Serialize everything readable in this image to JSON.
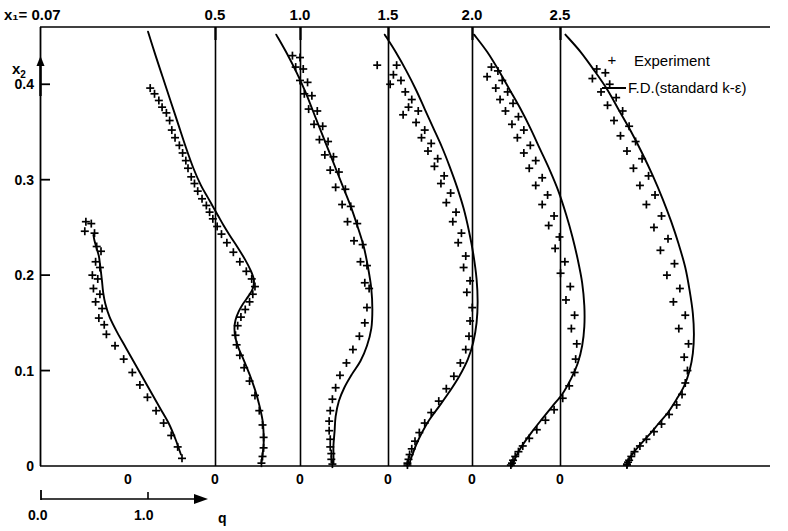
{
  "figure": {
    "x1_prefix": "x₁=",
    "y_axis_label": "x₂",
    "q_axis_label": "q"
  },
  "legend": {
    "position": "top-right",
    "items": [
      {
        "marker": "plus-marker",
        "label": "Experiment"
      },
      {
        "marker": "line-marker",
        "label": "F.D.(standard k-ε)"
      }
    ]
  },
  "axes": {
    "top_label_prefix": "x₁= 0.07",
    "top_tick_labels": [
      "0.5",
      "1.0",
      "1.5",
      "2.0",
      "2.5"
    ],
    "y_tick_labels": [
      "0",
      "0.1",
      "0.2",
      "0.3",
      "0.4"
    ],
    "y_tick_values": [
      0,
      0.1,
      0.2,
      0.3,
      0.4
    ],
    "station_zero_labels": [
      "0",
      "0",
      "0",
      "0",
      "0",
      "0"
    ],
    "scale_bar": {
      "start": "0.0",
      "mid": "1.0",
      "arrow_label": "q"
    }
  },
  "chart_data": {
    "type": "line",
    "title": "",
    "subtitle": "",
    "xlabel": "q",
    "ylabel": "x₂",
    "grid": false,
    "legend_position": "top-right",
    "ylim": [
      0,
      0.46
    ],
    "q_scale_px_per_unit": 108,
    "stations": [
      {
        "x1": 0.07,
        "baseline_label": "0",
        "baseline_px": 128,
        "model_curve": {
          "name": "F.D.(standard k-ε)",
          "q": [
            -0.32,
            -0.31,
            -0.29,
            -0.27,
            -0.26,
            -0.25,
            -0.24,
            -0.23,
            -0.21,
            -0.17,
            -0.1,
            -0.02,
            0.06,
            0.14,
            0.22,
            0.3,
            0.38,
            0.44,
            0.49
          ],
          "x2": [
            0.242,
            0.236,
            0.228,
            0.22,
            0.212,
            0.203,
            0.193,
            0.182,
            0.17,
            0.156,
            0.14,
            0.124,
            0.108,
            0.092,
            0.076,
            0.06,
            0.044,
            0.028,
            0.012
          ]
        },
        "experiment": {
          "name": "Experiment",
          "q": [
            -0.39,
            -0.34,
            -0.4,
            -0.31,
            -0.29,
            -0.25,
            -0.3,
            -0.26,
            -0.33,
            -0.28,
            -0.32,
            -0.26,
            -0.3,
            -0.24,
            -0.27,
            -0.22,
            -0.2,
            -0.12,
            -0.04,
            0.04,
            0.11,
            0.18,
            0.26,
            0.33,
            0.4,
            0.46,
            0.5
          ],
          "x2": [
            0.256,
            0.254,
            0.246,
            0.244,
            0.23,
            0.225,
            0.214,
            0.208,
            0.2,
            0.196,
            0.186,
            0.18,
            0.172,
            0.165,
            0.155,
            0.148,
            0.138,
            0.126,
            0.112,
            0.098,
            0.085,
            0.072,
            0.058,
            0.045,
            0.032,
            0.02,
            0.008
          ]
        }
      },
      {
        "x1": 0.5,
        "baseline_label": "0",
        "baseline_px": 215,
        "model_curve": {
          "name": "F.D.(standard k-ε)",
          "q": [
            -0.62,
            -0.55,
            -0.48,
            -0.41,
            -0.34,
            -0.27,
            -0.2,
            -0.13,
            -0.07,
            -0.02,
            0.03,
            0.08,
            0.14,
            0.21,
            0.28,
            0.33,
            0.36,
            0.35,
            0.31,
            0.26,
            0.22,
            0.19,
            0.18,
            0.19,
            0.22,
            0.27,
            0.32,
            0.37,
            0.41,
            0.44,
            0.45,
            0.45,
            0.44,
            0.43
          ],
          "x2": [
            0.455,
            0.43,
            0.406,
            0.382,
            0.358,
            0.334,
            0.312,
            0.294,
            0.282,
            0.272,
            0.262,
            0.252,
            0.241,
            0.229,
            0.216,
            0.205,
            0.195,
            0.186,
            0.178,
            0.17,
            0.162,
            0.153,
            0.144,
            0.134,
            0.123,
            0.11,
            0.096,
            0.08,
            0.064,
            0.048,
            0.034,
            0.022,
            0.012,
            0.004
          ]
        },
        "experiment": {
          "name": "Experiment",
          "q": [
            -0.6,
            -0.56,
            -0.52,
            -0.49,
            -0.45,
            -0.42,
            -0.4,
            -0.37,
            -0.33,
            -0.3,
            -0.27,
            -0.25,
            -0.22,
            -0.19,
            -0.16,
            -0.12,
            -0.08,
            -0.05,
            -0.02,
            0.02,
            0.06,
            0.11,
            0.17,
            0.23,
            0.29,
            0.34,
            0.37,
            0.35,
            0.32,
            0.28,
            0.24,
            0.21,
            0.19,
            0.2,
            0.23,
            0.27,
            0.32,
            0.37,
            0.41,
            0.44,
            0.45,
            0.45,
            0.44,
            0.43
          ],
          "x2": [
            0.396,
            0.39,
            0.383,
            0.376,
            0.37,
            0.362,
            0.352,
            0.344,
            0.336,
            0.328,
            0.32,
            0.312,
            0.303,
            0.296,
            0.288,
            0.28,
            0.273,
            0.266,
            0.259,
            0.251,
            0.243,
            0.234,
            0.224,
            0.214,
            0.204,
            0.196,
            0.188,
            0.18,
            0.172,
            0.164,
            0.156,
            0.147,
            0.137,
            0.127,
            0.116,
            0.103,
            0.089,
            0.074,
            0.058,
            0.043,
            0.03,
            0.019,
            0.01,
            0.003
          ]
        }
      },
      {
        "x1": 1.0,
        "baseline_label": "0",
        "baseline_px": 300,
        "model_curve": {
          "name": "F.D.(standard k-ε)",
          "q": [
            -0.22,
            -0.12,
            -0.03,
            0.05,
            0.12,
            0.19,
            0.26,
            0.33,
            0.4,
            0.47,
            0.53,
            0.59,
            0.63,
            0.66,
            0.67,
            0.66,
            0.62,
            0.56,
            0.48,
            0.41,
            0.36,
            0.33,
            0.32,
            0.31,
            0.31,
            0.31
          ],
          "x2": [
            0.452,
            0.432,
            0.412,
            0.392,
            0.372,
            0.352,
            0.332,
            0.312,
            0.292,
            0.272,
            0.252,
            0.23,
            0.208,
            0.186,
            0.164,
            0.144,
            0.126,
            0.11,
            0.096,
            0.082,
            0.068,
            0.052,
            0.036,
            0.022,
            0.011,
            0.003
          ]
        },
        "experiment": {
          "name": "Experiment",
          "q": [
            -0.07,
            0.0,
            -0.04,
            0.03,
            0.0,
            0.07,
            0.04,
            0.11,
            0.08,
            0.16,
            0.13,
            0.21,
            0.18,
            0.26,
            0.23,
            0.31,
            0.28,
            0.36,
            0.33,
            0.42,
            0.39,
            0.47,
            0.44,
            0.53,
            0.5,
            0.58,
            0.56,
            0.62,
            0.6,
            0.64,
            0.62,
            0.6,
            0.55,
            0.49,
            0.43,
            0.37,
            0.33,
            0.3,
            0.28,
            0.27,
            0.27,
            0.28,
            0.28,
            0.29,
            0.29,
            0.3
          ],
          "x2": [
            0.43,
            0.428,
            0.418,
            0.416,
            0.404,
            0.402,
            0.39,
            0.388,
            0.374,
            0.372,
            0.358,
            0.356,
            0.342,
            0.34,
            0.326,
            0.324,
            0.31,
            0.308,
            0.292,
            0.29,
            0.274,
            0.272,
            0.256,
            0.254,
            0.236,
            0.232,
            0.214,
            0.21,
            0.192,
            0.186,
            0.166,
            0.15,
            0.136,
            0.122,
            0.108,
            0.095,
            0.082,
            0.07,
            0.058,
            0.047,
            0.037,
            0.028,
            0.02,
            0.013,
            0.007,
            0.002
          ]
        }
      },
      {
        "x1": 1.5,
        "baseline_label": "0",
        "baseline_px": 388,
        "model_curve": {
          "name": "F.D.(standard k-ε)",
          "q": [
            -0.03,
            0.07,
            0.17,
            0.26,
            0.34,
            0.42,
            0.5,
            0.57,
            0.64,
            0.7,
            0.75,
            0.79,
            0.82,
            0.83,
            0.82,
            0.79,
            0.74,
            0.66,
            0.57,
            0.47,
            0.38,
            0.31,
            0.26,
            0.23,
            0.21,
            0.2
          ],
          "x2": [
            0.452,
            0.434,
            0.414,
            0.394,
            0.374,
            0.354,
            0.334,
            0.314,
            0.292,
            0.27,
            0.246,
            0.222,
            0.196,
            0.172,
            0.15,
            0.13,
            0.112,
            0.094,
            0.078,
            0.062,
            0.048,
            0.034,
            0.022,
            0.013,
            0.007,
            0.002
          ]
        },
        "experiment": {
          "name": "Experiment",
          "q": [
            -0.1,
            0.08,
            0.05,
            0.12,
            0.02,
            0.16,
            0.22,
            0.19,
            0.28,
            0.14,
            0.26,
            0.34,
            0.31,
            0.4,
            0.37,
            0.46,
            0.43,
            0.52,
            0.49,
            0.58,
            0.54,
            0.63,
            0.6,
            0.68,
            0.65,
            0.72,
            0.7,
            0.76,
            0.73,
            0.78,
            0.76,
            0.75,
            0.72,
            0.67,
            0.61,
            0.54,
            0.47,
            0.4,
            0.34,
            0.29,
            0.25,
            0.22,
            0.2,
            0.19,
            0.18,
            0.18
          ],
          "x2": [
            0.42,
            0.42,
            0.41,
            0.404,
            0.4,
            0.392,
            0.384,
            0.376,
            0.372,
            0.368,
            0.36,
            0.352,
            0.344,
            0.338,
            0.33,
            0.322,
            0.314,
            0.304,
            0.296,
            0.286,
            0.276,
            0.266,
            0.256,
            0.244,
            0.234,
            0.22,
            0.208,
            0.194,
            0.182,
            0.166,
            0.152,
            0.136,
            0.122,
            0.108,
            0.094,
            0.081,
            0.068,
            0.056,
            0.045,
            0.035,
            0.026,
            0.018,
            0.012,
            0.007,
            0.003,
            0.001
          ]
        }
      },
      {
        "x1": 2.0,
        "baseline_label": "0",
        "baseline_px": 472,
        "model_curve": {
          "name": "F.D.(standard k-ε)",
          "q": [
            0.02,
            0.14,
            0.25,
            0.35,
            0.45,
            0.54,
            0.63,
            0.72,
            0.8,
            0.87,
            0.93,
            0.98,
            1.02,
            1.04,
            1.04,
            1.02,
            0.98,
            0.92,
            0.84,
            0.74,
            0.64,
            0.55,
            0.48,
            0.43,
            0.4,
            0.38
          ],
          "x2": [
            0.452,
            0.434,
            0.414,
            0.394,
            0.374,
            0.354,
            0.332,
            0.31,
            0.288,
            0.264,
            0.24,
            0.216,
            0.192,
            0.168,
            0.146,
            0.126,
            0.108,
            0.092,
            0.076,
            0.062,
            0.048,
            0.035,
            0.024,
            0.015,
            0.008,
            0.002
          ]
        },
        "experiment": {
          "name": "Experiment",
          "q": [
            0.18,
            0.24,
            0.14,
            0.28,
            0.22,
            0.33,
            0.26,
            0.38,
            0.31,
            0.43,
            0.37,
            0.48,
            0.42,
            0.54,
            0.48,
            0.59,
            0.53,
            0.65,
            0.59,
            0.7,
            0.65,
            0.76,
            0.71,
            0.81,
            0.77,
            0.86,
            0.82,
            0.91,
            0.87,
            0.95,
            0.92,
            0.97,
            0.96,
            0.95,
            0.9,
            0.84,
            0.76,
            0.68,
            0.6,
            0.53,
            0.47,
            0.43,
            0.4,
            0.38,
            0.37,
            0.36
          ],
          "x2": [
            0.418,
            0.414,
            0.408,
            0.404,
            0.396,
            0.392,
            0.384,
            0.38,
            0.372,
            0.366,
            0.358,
            0.352,
            0.344,
            0.336,
            0.328,
            0.32,
            0.312,
            0.302,
            0.294,
            0.284,
            0.274,
            0.262,
            0.252,
            0.24,
            0.228,
            0.214,
            0.202,
            0.188,
            0.174,
            0.158,
            0.144,
            0.128,
            0.112,
            0.098,
            0.084,
            0.071,
            0.059,
            0.048,
            0.038,
            0.029,
            0.021,
            0.015,
            0.01,
            0.006,
            0.003,
            0.001
          ]
        }
      },
      {
        "x1": 2.5,
        "baseline_label": "0",
        "baseline_px": 560,
        "model_curve": {
          "name": "F.D.(standard k-ε)",
          "q": [
            0.05,
            0.19,
            0.32,
            0.44,
            0.55,
            0.66,
            0.76,
            0.86,
            0.95,
            1.03,
            1.1,
            1.16,
            1.2,
            1.23,
            1.24,
            1.23,
            1.2,
            1.15,
            1.08,
            1.0,
            0.91,
            0.82,
            0.74,
            0.68,
            0.64,
            0.62
          ],
          "x2": [
            0.452,
            0.434,
            0.414,
            0.394,
            0.372,
            0.35,
            0.328,
            0.304,
            0.28,
            0.256,
            0.232,
            0.208,
            0.184,
            0.16,
            0.138,
            0.118,
            0.1,
            0.084,
            0.07,
            0.056,
            0.044,
            0.032,
            0.022,
            0.014,
            0.007,
            0.002
          ]
        },
        "experiment": {
          "name": "Experiment",
          "q": [
            0.34,
            0.42,
            0.3,
            0.46,
            0.38,
            0.52,
            0.44,
            0.58,
            0.5,
            0.64,
            0.56,
            0.7,
            0.62,
            0.76,
            0.68,
            0.82,
            0.74,
            0.88,
            0.8,
            0.94,
            0.87,
            1.0,
            0.93,
            1.06,
            0.99,
            1.11,
            1.05,
            1.16,
            1.1,
            1.19,
            1.15,
            1.18,
            1.16,
            1.13,
            1.08,
            1.01,
            0.94,
            0.87,
            0.8,
            0.74,
            0.69,
            0.66,
            0.64,
            0.63,
            0.62,
            0.62
          ],
          "x2": [
            0.416,
            0.412,
            0.406,
            0.4,
            0.392,
            0.386,
            0.378,
            0.372,
            0.362,
            0.356,
            0.346,
            0.34,
            0.33,
            0.322,
            0.312,
            0.304,
            0.294,
            0.284,
            0.274,
            0.262,
            0.25,
            0.238,
            0.226,
            0.212,
            0.2,
            0.186,
            0.172,
            0.158,
            0.144,
            0.128,
            0.114,
            0.1,
            0.087,
            0.075,
            0.064,
            0.054,
            0.044,
            0.036,
            0.028,
            0.021,
            0.015,
            0.01,
            0.006,
            0.004,
            0.002,
            0.001
          ]
        }
      }
    ]
  }
}
